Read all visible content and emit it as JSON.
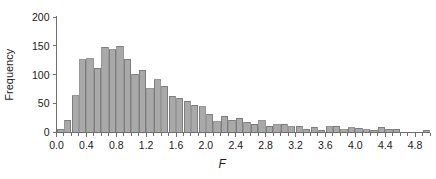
{
  "chart_data": {
    "type": "bar",
    "title": "",
    "subtitle": "",
    "xlabel": "F",
    "ylabel": "Frequency",
    "xlim": [
      0.0,
      5.0
    ],
    "ylim": [
      0,
      200
    ],
    "grid": false,
    "legend": null,
    "bin_width": 0.1,
    "x_tick_labels": [
      "0.0",
      "0.4",
      "0.8",
      "1.2",
      "1.6",
      "2.0",
      "2.4",
      "2.8",
      "3.2",
      "3.6",
      "4.0",
      "4.4",
      "4.8"
    ],
    "x_tick_values": [
      0.0,
      0.4,
      0.8,
      1.2,
      1.6,
      2.0,
      2.4,
      2.8,
      3.2,
      3.6,
      4.0,
      4.4,
      4.8
    ],
    "x_minor_tick_step": 0.1,
    "y_tick_labels": [
      "0",
      "50",
      "100",
      "150",
      "200"
    ],
    "y_tick_values": [
      0,
      50,
      100,
      150,
      200
    ],
    "categories": [
      0.05,
      0.15,
      0.25,
      0.35,
      0.45,
      0.55,
      0.65,
      0.75,
      0.85,
      0.95,
      1.05,
      1.15,
      1.25,
      1.35,
      1.45,
      1.55,
      1.65,
      1.75,
      1.85,
      1.95,
      2.05,
      2.15,
      2.25,
      2.35,
      2.45,
      2.55,
      2.65,
      2.75,
      2.85,
      2.95,
      3.05,
      3.15,
      3.25,
      3.35,
      3.45,
      3.55,
      3.65,
      3.75,
      3.85,
      3.95,
      4.05,
      4.15,
      4.25,
      4.35,
      4.45,
      4.55,
      4.65,
      4.75,
      4.85,
      4.95
    ],
    "values": [
      6,
      21,
      64,
      126,
      128,
      111,
      148,
      143,
      149,
      127,
      101,
      108,
      76,
      91,
      80,
      63,
      59,
      54,
      47,
      45,
      32,
      19,
      28,
      21,
      25,
      18,
      14,
      20,
      11,
      13,
      14,
      10,
      11,
      6,
      9,
      4,
      10,
      11,
      5,
      8,
      7,
      5,
      4,
      9,
      6,
      6,
      0,
      0,
      0,
      4
    ],
    "bar_fill_color": "#a9a9a9",
    "bar_stroke_color": "#6b6b6b",
    "axis_color": "#6e6e6e",
    "text_color": "#1a1a1a",
    "background_color": "#ffffff"
  }
}
